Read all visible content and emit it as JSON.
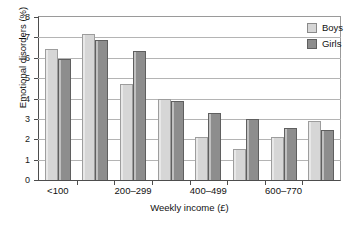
{
  "chart_data": {
    "type": "bar",
    "title": "",
    "xlabel": "Weekly income (£)",
    "ylabel": "Emotional disorders (%)",
    "ylim": [
      0,
      8
    ],
    "yticks": [
      0,
      1,
      2,
      3,
      4,
      5,
      6,
      7,
      8
    ],
    "grid": true,
    "legend_position": "top-right",
    "categories": [
      "<100",
      "100–199",
      "200–299",
      "300–399",
      "400–499",
      "500–599",
      "600–770",
      ">770"
    ],
    "visible_tick_labels": [
      "<100",
      "200–299",
      "400–499",
      "600–770"
    ],
    "visible_tick_label_indices": [
      0,
      2,
      4,
      6
    ],
    "series": [
      {
        "name": "Boys",
        "color": "#d6d6d6",
        "values": [
          6.45,
          7.15,
          4.7,
          4.0,
          2.1,
          1.5,
          2.1,
          2.9
        ]
      },
      {
        "name": "Girls",
        "color": "#8d8d8d",
        "values": [
          5.95,
          6.85,
          6.35,
          3.9,
          3.3,
          3.0,
          2.55,
          2.45
        ]
      }
    ]
  },
  "legend": {
    "items": [
      {
        "label": "Boys",
        "swatch": "boys-swatch"
      },
      {
        "label": "Girls",
        "swatch": "girls-swatch"
      }
    ]
  },
  "axes": {
    "y_title": "Emotional disorders (%)",
    "x_title": "Weekly income (£)"
  },
  "caption": {
    "text": ""
  }
}
